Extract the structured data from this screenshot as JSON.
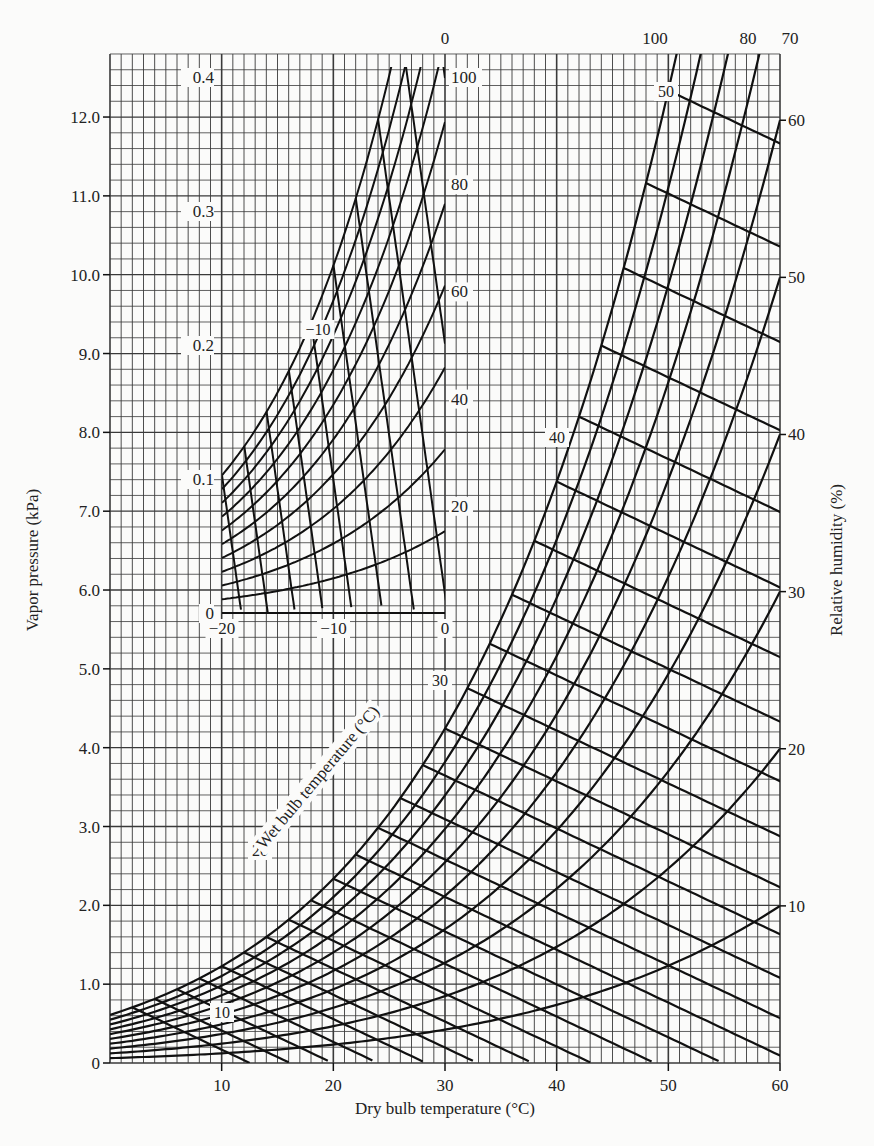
{
  "chart_data": [
    {
      "type": "line",
      "title": "",
      "subtitle": "Psychrometric chart: vapor pressure vs dry bulb temperature",
      "xlabel": "Dry bulb temperature (°C)",
      "ylabel": "Vapor pressure (kPa)",
      "y2label": "Relative humidity (%)",
      "diagonal_label": "Wet bulb temperature (°C)",
      "xlim": [
        0,
        60
      ],
      "ylim": [
        0,
        12.8
      ],
      "grid": true,
      "x_ticks": [
        10,
        20,
        30,
        40,
        50,
        60
      ],
      "x_tick_labels": [
        "10",
        "20",
        "30",
        "40",
        "50",
        "60"
      ],
      "y_ticks": [
        0,
        1.0,
        2.0,
        3.0,
        4.0,
        5.0,
        6.0,
        7.0,
        8.0,
        9.0,
        10.0,
        11.0,
        12.0
      ],
      "y_tick_labels": [
        "0",
        "1.0",
        "2.0",
        "3.0",
        "4.0",
        "5.0",
        "6.0",
        "7.0",
        "8.0",
        "9.0",
        "10.0",
        "11.0",
        "12.0"
      ],
      "relative_humidity_curves": {
        "values_percent": [
          10,
          20,
          30,
          40,
          50,
          60,
          70,
          80,
          90,
          100
        ],
        "labeled": [
          {
            "label": "10",
            "position": "right",
            "at_vp_kPa": 1.99
          },
          {
            "label": "20",
            "position": "right",
            "at_vp_kPa": 3.98
          },
          {
            "label": "30",
            "position": "right",
            "at_vp_kPa": 5.97
          },
          {
            "label": "40",
            "position": "right",
            "at_vp_kPa": 7.97
          },
          {
            "label": "50",
            "position": "right",
            "at_vp_kPa": 9.96
          },
          {
            "label": "60",
            "position": "right",
            "at_vp_kPa": 11.95
          },
          {
            "label": "70",
            "position": "top"
          },
          {
            "label": "80",
            "position": "top"
          },
          {
            "label": "100",
            "position": "top"
          }
        ]
      },
      "wet_bulb_lines": {
        "values_C": [
          2,
          4,
          6,
          8,
          10,
          12,
          14,
          16,
          18,
          20,
          22,
          24,
          26,
          28,
          30,
          32,
          34,
          36,
          38,
          40,
          42,
          44,
          46,
          48,
          50
        ],
        "labeled": [
          "10",
          "20",
          "30",
          "40",
          "50"
        ]
      },
      "saturation_vapor_pressure_kPa": [
        {
          "T": 0,
          "vp": 0.611
        },
        {
          "T": 10,
          "vp": 1.228
        },
        {
          "T": 20,
          "vp": 2.339
        },
        {
          "T": 30,
          "vp": 4.246
        },
        {
          "T": 40,
          "vp": 7.384
        },
        {
          "T": 50,
          "vp": 12.35
        },
        {
          "T": 60,
          "vp": 19.94
        }
      ]
    },
    {
      "type": "line",
      "title": "Inset: below-freezing region",
      "xlabel": "Dry bulb temperature (°C)",
      "ylabel": "Vapor pressure (kPa)",
      "xlim": [
        -20,
        0
      ],
      "ylim": [
        0,
        0.4
      ],
      "grid": true,
      "x_ticks": [
        -20,
        -10,
        0
      ],
      "x_tick_labels": [
        "−20",
        "−10",
        "0"
      ],
      "y_ticks": [
        0,
        0.1,
        0.2,
        0.3,
        0.4
      ],
      "y_tick_labels": [
        "0",
        "0.1",
        "0.2",
        "0.3",
        "0.4"
      ],
      "relative_humidity_curves": {
        "values_percent": [
          10,
          20,
          30,
          40,
          50,
          60,
          70,
          80,
          90,
          100
        ],
        "labeled": [
          "20",
          "40",
          "60",
          "80",
          "100"
        ]
      },
      "wet_bulb_lines": {
        "values_C": [
          -20,
          -18,
          -16,
          -14,
          -12,
          -10,
          -8,
          -6,
          -4,
          -2,
          0
        ],
        "labeled": [
          "−10",
          "0"
        ]
      },
      "saturation_vapor_pressure_kPa": [
        {
          "T": -20,
          "vp": 0.103
        },
        {
          "T": -10,
          "vp": 0.26
        },
        {
          "T": 0,
          "vp": 0.611
        }
      ]
    }
  ],
  "labels": {
    "xlabel": "Dry bulb temperature (°C)",
    "ylabel": "Vapor pressure (kPa)",
    "y2label": "Relative humidity (%)",
    "wetbulb": "Wet bulb temperature (°C)",
    "caption": "Figure: vapor pressure, relative humidity, dry bulb and wet bulb temperature relationships"
  },
  "colors": {
    "background": "#fbfbfa",
    "grid": "#3a3a3a",
    "curves": "#111111",
    "text": "#222222"
  }
}
